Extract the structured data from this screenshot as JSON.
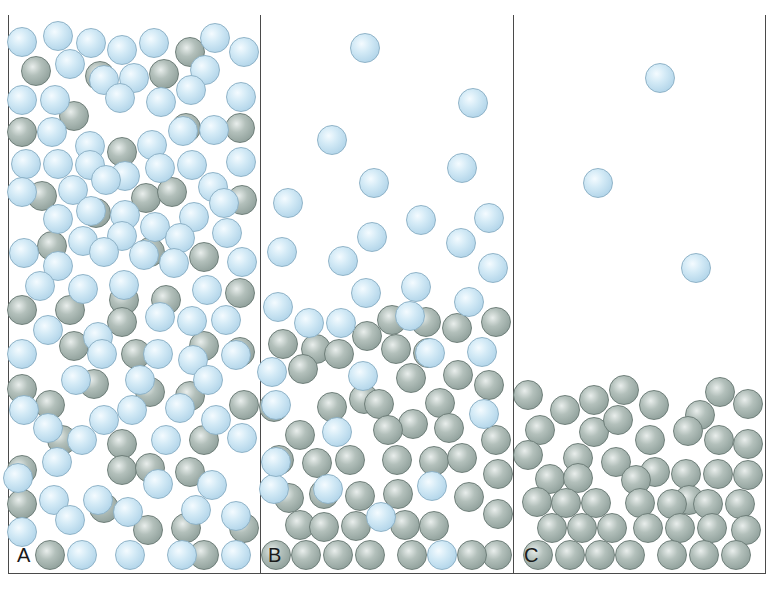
{
  "figure": {
    "colors": {
      "light_ball": "#c6e2f2",
      "dark_ball": "#9aa9a4",
      "border": "#4a4a4a",
      "background": "#ffffff"
    },
    "panels": [
      {
        "label": "A",
        "x": 8,
        "width": 252,
        "light": [
          [
            22,
            42
          ],
          [
            58,
            36
          ],
          [
            91,
            43
          ],
          [
            122,
            50
          ],
          [
            154,
            43
          ],
          [
            215,
            38
          ],
          [
            244,
            52
          ],
          [
            70,
            64
          ],
          [
            104,
            80
          ],
          [
            134,
            78
          ],
          [
            205,
            70
          ],
          [
            22,
            100
          ],
          [
            55,
            100
          ],
          [
            120,
            98
          ],
          [
            161,
            102
          ],
          [
            191,
            90
          ],
          [
            241,
            97
          ],
          [
            52,
            132
          ],
          [
            90,
            146
          ],
          [
            152,
            145
          ],
          [
            183,
            131
          ],
          [
            214,
            130
          ],
          [
            241,
            162
          ],
          [
            26,
            164
          ],
          [
            58,
            164
          ],
          [
            90,
            165
          ],
          [
            125,
            176
          ],
          [
            160,
            168
          ],
          [
            192,
            165
          ],
          [
            22,
            192
          ],
          [
            73,
            190
          ],
          [
            106,
            180
          ],
          [
            213,
            187
          ],
          [
            58,
            219
          ],
          [
            91,
            211
          ],
          [
            125,
            215
          ],
          [
            155,
            227
          ],
          [
            194,
            217
          ],
          [
            224,
            203
          ],
          [
            24,
            253
          ],
          [
            83,
            241
          ],
          [
            122,
            236
          ],
          [
            180,
            238
          ],
          [
            227,
            233
          ],
          [
            58,
            266
          ],
          [
            104,
            252
          ],
          [
            144,
            255
          ],
          [
            174,
            263
          ],
          [
            242,
            262
          ],
          [
            40,
            286
          ],
          [
            83,
            289
          ],
          [
            124,
            285
          ],
          [
            207,
            290
          ],
          [
            48,
            330
          ],
          [
            98,
            337
          ],
          [
            160,
            317
          ],
          [
            192,
            321
          ],
          [
            226,
            320
          ],
          [
            22,
            354
          ],
          [
            102,
            354
          ],
          [
            158,
            354
          ],
          [
            193,
            360
          ],
          [
            236,
            355
          ],
          [
            76,
            380
          ],
          [
            140,
            380
          ],
          [
            208,
            380
          ],
          [
            24,
            410
          ],
          [
            48,
            428
          ],
          [
            104,
            420
          ],
          [
            132,
            410
          ],
          [
            180,
            408
          ],
          [
            216,
            420
          ],
          [
            57,
            462
          ],
          [
            82,
            440
          ],
          [
            166,
            440
          ],
          [
            242,
            438
          ],
          [
            18,
            478
          ],
          [
            54,
            500
          ],
          [
            98,
            500
          ],
          [
            158,
            484
          ],
          [
            212,
            485
          ],
          [
            22,
            532
          ],
          [
            70,
            520
          ],
          [
            128,
            512
          ],
          [
            196,
            510
          ],
          [
            236,
            516
          ],
          [
            82,
            555
          ],
          [
            130,
            555
          ],
          [
            182,
            555
          ],
          [
            236,
            555
          ]
        ],
        "dark": [
          [
            36,
            71
          ],
          [
            100,
            76
          ],
          [
            164,
            74
          ],
          [
            190,
            52
          ],
          [
            22,
            132
          ],
          [
            74,
            116
          ],
          [
            122,
            152
          ],
          [
            186,
            128
          ],
          [
            240,
            128
          ],
          [
            42,
            196
          ],
          [
            96,
            213
          ],
          [
            146,
            198
          ],
          [
            172,
            192
          ],
          [
            242,
            200
          ],
          [
            52,
            246
          ],
          [
            150,
            252
          ],
          [
            204,
            257
          ],
          [
            22,
            310
          ],
          [
            70,
            310
          ],
          [
            124,
            300
          ],
          [
            166,
            300
          ],
          [
            240,
            293
          ],
          [
            74,
            346
          ],
          [
            122,
            322
          ],
          [
            136,
            354
          ],
          [
            204,
            346
          ],
          [
            240,
            352
          ],
          [
            22,
            389
          ],
          [
            50,
            405
          ],
          [
            94,
            384
          ],
          [
            150,
            392
          ],
          [
            190,
            396
          ],
          [
            244,
            405
          ],
          [
            62,
            440
          ],
          [
            122,
            444
          ],
          [
            204,
            440
          ],
          [
            22,
            470
          ],
          [
            122,
            470
          ],
          [
            150,
            468
          ],
          [
            190,
            472
          ],
          [
            22,
            504
          ],
          [
            104,
            508
          ],
          [
            148,
            530
          ],
          [
            186,
            528
          ],
          [
            244,
            528
          ],
          [
            50,
            555
          ],
          [
            204,
            555
          ]
        ]
      },
      {
        "label": "B",
        "x": 260,
        "width": 253,
        "light": [
          [
            365,
            48
          ],
          [
            473,
            103
          ],
          [
            332,
            140
          ],
          [
            462,
            168
          ],
          [
            374,
            183
          ],
          [
            288,
            203
          ],
          [
            421,
            220
          ],
          [
            489,
            218
          ],
          [
            372,
            237
          ],
          [
            282,
            252
          ],
          [
            461,
            243
          ],
          [
            343,
            261
          ],
          [
            493,
            268
          ],
          [
            366,
            293
          ],
          [
            416,
            287
          ],
          [
            278,
            307
          ],
          [
            469,
            302
          ],
          [
            309,
            323
          ],
          [
            341,
            323
          ],
          [
            410,
            316
          ],
          [
            430,
            353
          ],
          [
            482,
            352
          ],
          [
            272,
            372
          ],
          [
            363,
            376
          ],
          [
            276,
            405
          ],
          [
            484,
            414
          ],
          [
            337,
            432
          ],
          [
            328,
            489
          ],
          [
            432,
            486
          ],
          [
            274,
            489
          ],
          [
            381,
            517
          ],
          [
            442,
            555
          ],
          [
            276,
            462
          ]
        ],
        "dark": [
          [
            392,
            320
          ],
          [
            426,
            322
          ],
          [
            457,
            328
          ],
          [
            496,
            322
          ],
          [
            283,
            344
          ],
          [
            316,
            349
          ],
          [
            339,
            354
          ],
          [
            367,
            336
          ],
          [
            396,
            349
          ],
          [
            428,
            353
          ],
          [
            458,
            375
          ],
          [
            489,
            385
          ],
          [
            303,
            369
          ],
          [
            364,
            399
          ],
          [
            411,
            378
          ],
          [
            440,
            403
          ],
          [
            332,
            407
          ],
          [
            274,
            407
          ],
          [
            300,
            435
          ],
          [
            379,
            404
          ],
          [
            413,
            424
          ],
          [
            449,
            428
          ],
          [
            496,
            440
          ],
          [
            498,
            474
          ],
          [
            279,
            460
          ],
          [
            317,
            463
          ],
          [
            350,
            460
          ],
          [
            388,
            430
          ],
          [
            397,
            460
          ],
          [
            434,
            461
          ],
          [
            462,
            458
          ],
          [
            289,
            498
          ],
          [
            324,
            494
          ],
          [
            360,
            496
          ],
          [
            398,
            494
          ],
          [
            469,
            497
          ],
          [
            498,
            514
          ],
          [
            300,
            525
          ],
          [
            324,
            527
          ],
          [
            356,
            526
          ],
          [
            405,
            525
          ],
          [
            434,
            526
          ],
          [
            497,
            555
          ],
          [
            276,
            555
          ],
          [
            306,
            555
          ],
          [
            338,
            555
          ],
          [
            370,
            555
          ],
          [
            412,
            555
          ],
          [
            472,
            555
          ]
        ]
      },
      {
        "label": "C",
        "x": 513,
        "width": 252,
        "light": [
          [
            660,
            78
          ],
          [
            598,
            183
          ],
          [
            696,
            268
          ]
        ],
        "dark": [
          [
            528,
            395
          ],
          [
            624,
            390
          ],
          [
            720,
            392
          ],
          [
            565,
            410
          ],
          [
            594,
            400
          ],
          [
            654,
            405
          ],
          [
            700,
            415
          ],
          [
            748,
            404
          ],
          [
            540,
            430
          ],
          [
            594,
            432
          ],
          [
            618,
            420
          ],
          [
            650,
            440
          ],
          [
            688,
            431
          ],
          [
            719,
            440
          ],
          [
            748,
            444
          ],
          [
            528,
            455
          ],
          [
            578,
            458
          ],
          [
            616,
            462
          ],
          [
            655,
            472
          ],
          [
            686,
            474
          ],
          [
            718,
            474
          ],
          [
            748,
            475
          ],
          [
            550,
            479
          ],
          [
            578,
            478
          ],
          [
            636,
            480
          ],
          [
            689,
            500
          ],
          [
            537,
            502
          ],
          [
            566,
            503
          ],
          [
            596,
            503
          ],
          [
            640,
            503
          ],
          [
            672,
            504
          ],
          [
            708,
            504
          ],
          [
            740,
            504
          ],
          [
            552,
            528
          ],
          [
            582,
            528
          ],
          [
            612,
            528
          ],
          [
            648,
            528
          ],
          [
            680,
            528
          ],
          [
            712,
            528
          ],
          [
            746,
            530
          ],
          [
            538,
            555
          ],
          [
            570,
            555
          ],
          [
            600,
            555
          ],
          [
            630,
            555
          ],
          [
            672,
            555
          ],
          [
            704,
            555
          ],
          [
            736,
            555
          ]
        ]
      }
    ]
  }
}
